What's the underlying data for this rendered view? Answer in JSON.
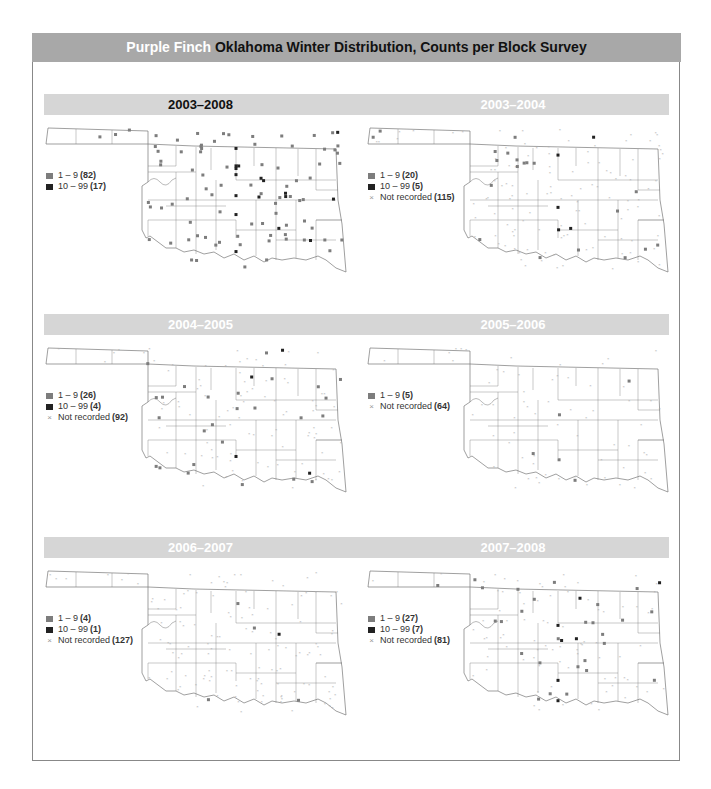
{
  "header": {
    "species": "Purple Finch",
    "title": "Oklahoma Winter Distribution, Counts per Block Survey"
  },
  "colors": {
    "header_bg": "#a8a8a8",
    "bar_bg": "#d6d6d6",
    "marker_1_9": "#7d7d7d",
    "marker_10_99": "#222222",
    "marker_not_recorded": "#999999"
  },
  "panels": [
    {
      "title": "2003–2008",
      "title_style": "dark",
      "legend": [
        {
          "type": "light",
          "label": "1 – 9",
          "count": "(82)"
        },
        {
          "type": "dark",
          "label": "10 – 99",
          "count": "(17)"
        }
      ]
    },
    {
      "title": "2003–2004",
      "title_style": "light",
      "legend": [
        {
          "type": "light",
          "label": "1 – 9",
          "count": "(20)"
        },
        {
          "type": "dark",
          "label": "10 – 99",
          "count": "(5)"
        },
        {
          "type": "x",
          "label": "Not recorded",
          "count": "(115)"
        }
      ]
    },
    {
      "title": "2004–2005",
      "title_style": "light",
      "legend": [
        {
          "type": "light",
          "label": "1 – 9",
          "count": "(26)"
        },
        {
          "type": "dark",
          "label": "10 – 99",
          "count": "(4)"
        },
        {
          "type": "x",
          "label": "Not recorded",
          "count": "(92)"
        }
      ]
    },
    {
      "title": "2005–2006",
      "title_style": "light",
      "legend": [
        {
          "type": "light",
          "label": "1 – 9",
          "count": "(5)"
        },
        {
          "type": "x",
          "label": "Not recorded",
          "count": "(64)"
        }
      ]
    },
    {
      "title": "2006–2007",
      "title_style": "light",
      "legend": [
        {
          "type": "light",
          "label": "1 – 9",
          "count": "(4)"
        },
        {
          "type": "dark",
          "label": "10 – 99",
          "count": "(1)"
        },
        {
          "type": "x",
          "label": "Not recorded",
          "count": "(127)"
        }
      ]
    },
    {
      "title": "2007–2008",
      "title_style": "light",
      "legend": [
        {
          "type": "light",
          "label": "1 – 9",
          "count": "(27)"
        },
        {
          "type": "dark",
          "label": "10 – 99",
          "count": "(7)"
        },
        {
          "type": "x",
          "label": "Not recorded",
          "count": "(81)"
        }
      ]
    }
  ]
}
